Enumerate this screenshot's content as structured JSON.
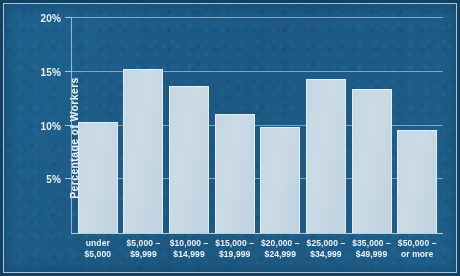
{
  "chart_data": {
    "type": "bar",
    "title": "",
    "xlabel": "",
    "ylabel": "Percentage of Workers",
    "ylim": [
      0,
      20
    ],
    "yticks": [
      5,
      10,
      15,
      20
    ],
    "ytick_labels": [
      "5%",
      "10%",
      "15%",
      "20%"
    ],
    "grid": true,
    "legend": null,
    "categories": [
      "under $5,000",
      "$5,000 – $9,999",
      "$10,000 – $14,999",
      "$15,000 – $19,999",
      "$20,000 – $24,999",
      "$25,000 – $34,999",
      "$35,000 – $49,999",
      "$50,000 – or more"
    ],
    "category_lines": [
      [
        "under",
        "$5,000"
      ],
      [
        "$5,000 –",
        "$9,999"
      ],
      [
        "$10,000 –",
        "$14,999"
      ],
      [
        "$15,000 –",
        "$19,999"
      ],
      [
        "$20,000 –",
        "$24,999"
      ],
      [
        "$25,000 –",
        "$34,999"
      ],
      [
        "$35,000 –",
        "$49,999"
      ],
      [
        "$50,000 –",
        "or more"
      ]
    ],
    "values": [
      10.3,
      15.3,
      13.7,
      11.1,
      9.9,
      14.3,
      13.4,
      9.6
    ],
    "value_unit": "%",
    "colors": {
      "background": "#1d5c87",
      "bar_fill": "#c6d7e3",
      "bar_edge": "#e4eef5",
      "gridline": "#bad4e6",
      "text": "#eef4f9"
    }
  }
}
